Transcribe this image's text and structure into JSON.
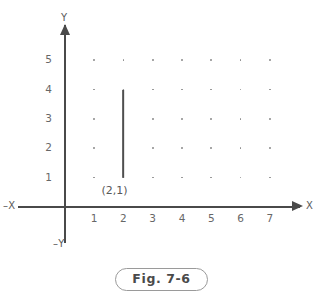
{
  "figure": {
    "caption": "Fig. 7-6",
    "axis_labels": {
      "x_positive": "X",
      "x_negative": "–X",
      "y_positive": "Y",
      "y_negative": "–Y"
    },
    "annotations": [
      {
        "text": "(2,1)",
        "x": 2,
        "y": 1
      }
    ],
    "colors": {
      "axis": "#4a4a4a",
      "dot": "#8d8d8d",
      "segment": "#4e4e4e",
      "tick_text": "#676767",
      "caption_border": "#9a9a9a",
      "background": "#ffffff"
    }
  },
  "chart_data": {
    "type": "scatter",
    "title": "Fig. 7-6",
    "xlabel": "X",
    "ylabel": "Y",
    "xlim": [
      0,
      7.6
    ],
    "ylim": [
      0,
      5.6
    ],
    "grid": false,
    "x_tick_labels": [
      "1",
      "2",
      "3",
      "4",
      "5",
      "6",
      "7"
    ],
    "y_tick_labels": [
      "1",
      "2",
      "3",
      "4",
      "5"
    ],
    "x_ticks": [
      1,
      2,
      3,
      4,
      5,
      6,
      7
    ],
    "y_ticks": [
      1,
      2,
      3,
      4,
      5
    ],
    "lattice_dots": {
      "description": "grid of small dots at every integer lattice point",
      "x_values": [
        1,
        2,
        3,
        4,
        5,
        6,
        7
      ],
      "y_values": [
        1,
        2,
        3,
        4,
        5
      ]
    },
    "series": [
      {
        "name": "vertical segment at x = 2",
        "type": "line",
        "x": [
          2,
          2
        ],
        "y": [
          1,
          4
        ]
      }
    ],
    "annotations": [
      {
        "label": "(2,1)",
        "x": 2,
        "y": 1
      }
    ]
  }
}
